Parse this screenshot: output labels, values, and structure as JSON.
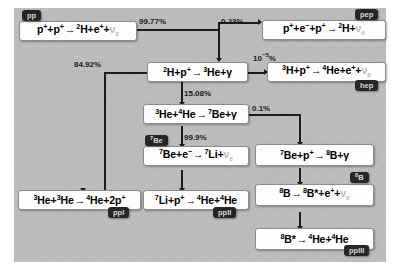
{
  "diagram": {
    "colors": {
      "plate": "#bdbdbd",
      "box": "#fdfdfd",
      "tag": "#262626",
      "tag_text": "#d8d8d8",
      "line": "#1c1c1c",
      "neutrino": "#b9b9b9"
    }
  },
  "reactions": {
    "pp": {
      "tag": "pp",
      "parts": [
        {
          "t": "p",
          "sup": "+"
        },
        {
          "t": "+"
        },
        {
          "t": "p",
          "sup": "+"
        },
        {
          "t": "→",
          "cls": "arr"
        },
        {
          "pre": "2",
          "t": "H"
        },
        {
          "t": "+"
        },
        {
          "t": "e",
          "sup": "+"
        },
        {
          "t": "+"
        },
        {
          "t": "ν",
          "sub": "e",
          "cls": "nu"
        }
      ],
      "plain": "p+ + p+ → 2H + e+ + νe"
    },
    "pep": {
      "tag": "pep",
      "parts": [
        {
          "t": "p",
          "sup": "+"
        },
        {
          "t": "+"
        },
        {
          "t": "e",
          "sup": "−"
        },
        {
          "t": "+"
        },
        {
          "t": "p",
          "sup": "+"
        },
        {
          "t": "→",
          "cls": "arr"
        },
        {
          "pre": "2",
          "t": "H"
        },
        {
          "t": "+"
        },
        {
          "t": "ν",
          "sub": "e",
          "cls": "nu"
        }
      ],
      "plain": "p+ + e− + p+ → 2H + νe"
    },
    "deuterium": {
      "tag": "",
      "parts": [
        {
          "pre": "2",
          "t": "H"
        },
        {
          "t": "+"
        },
        {
          "t": "p",
          "sup": "+"
        },
        {
          "t": "→",
          "cls": "arr"
        },
        {
          "pre": "3",
          "t": "He"
        },
        {
          "t": "+"
        },
        {
          "t": "γ",
          "cls": "gam"
        }
      ],
      "plain": "2H + p+ → 3He + γ"
    },
    "hep": {
      "tag": "hep",
      "parts": [
        {
          "pre": "3",
          "t": "H"
        },
        {
          "t": "+"
        },
        {
          "t": "p",
          "sup": "+"
        },
        {
          "t": "→",
          "cls": "arr"
        },
        {
          "pre": "4",
          "t": "He"
        },
        {
          "t": "+"
        },
        {
          "t": "e",
          "sup": "+"
        },
        {
          "t": "+"
        },
        {
          "t": "ν",
          "sub": "e",
          "cls": "nu"
        }
      ],
      "plain": "3H + p+ → 4He + e+ + νe"
    },
    "he3he4": {
      "tag": "",
      "parts": [
        {
          "pre": "3",
          "t": "He"
        },
        {
          "t": "+"
        },
        {
          "pre": "4",
          "t": "He"
        },
        {
          "t": "→",
          "cls": "arr"
        },
        {
          "pre": "7",
          "t": "Be"
        },
        {
          "t": "+"
        },
        {
          "t": "γ",
          "cls": "gam"
        }
      ],
      "plain": "3He + 4He → 7Be + γ"
    },
    "be7capture": {
      "tag_pre": "7",
      "tag": "Be",
      "parts": [
        {
          "pre": "7",
          "t": "Be"
        },
        {
          "t": "+"
        },
        {
          "t": "e",
          "sup": "−"
        },
        {
          "t": "→",
          "cls": "arr"
        },
        {
          "pre": "7",
          "t": "Li"
        },
        {
          "t": "+"
        },
        {
          "t": "ν",
          "sub": "e",
          "cls": "nu"
        }
      ],
      "plain": "7Be + e− → 7Li + νe"
    },
    "ppI": {
      "tag": "ppI",
      "parts": [
        {
          "pre": "3",
          "t": "He"
        },
        {
          "t": "+"
        },
        {
          "pre": "3",
          "t": "He"
        },
        {
          "t": "→",
          "cls": "arr"
        },
        {
          "pre": "4",
          "t": "He"
        },
        {
          "t": "+2"
        },
        {
          "t": "p",
          "sup": "+"
        }
      ],
      "plain": "3He + 3He → 4He + 2p+"
    },
    "ppII": {
      "tag": "ppII",
      "parts": [
        {
          "pre": "7",
          "t": "Li"
        },
        {
          "t": "+"
        },
        {
          "t": "p",
          "sup": "+"
        },
        {
          "t": "→",
          "cls": "arr"
        },
        {
          "pre": "4",
          "t": "He"
        },
        {
          "t": "+"
        },
        {
          "pre": "4",
          "t": "He"
        }
      ],
      "plain": "7Li + p+ → 4He + 4He"
    },
    "b8form": {
      "tag": "",
      "parts": [
        {
          "pre": "7",
          "t": "Be"
        },
        {
          "t": "+"
        },
        {
          "t": "p",
          "sup": "+"
        },
        {
          "t": "→",
          "cls": "arr"
        },
        {
          "pre": "8",
          "t": "B"
        },
        {
          "t": "+"
        },
        {
          "t": "γ",
          "cls": "gam"
        }
      ],
      "plain": "7Be + p+ → 8B + γ"
    },
    "b8decay": {
      "tag_pre": "8",
      "tag": "B",
      "parts": [
        {
          "pre": "8",
          "t": "B"
        },
        {
          "t": "→",
          "cls": "arr"
        },
        {
          "pre": "8",
          "t": "B*"
        },
        {
          "t": "+"
        },
        {
          "t": "e",
          "sup": "+"
        },
        {
          "t": "+"
        },
        {
          "t": "ν",
          "sub": "e",
          "cls": "nu"
        }
      ],
      "plain": "8B → 8B* + e+ + νe"
    },
    "ppIII": {
      "tag": "ppIII",
      "parts": [
        {
          "pre": "8",
          "t": "B*"
        },
        {
          "t": "→",
          "cls": "arr"
        },
        {
          "pre": "4",
          "t": "He"
        },
        {
          "t": "+"
        },
        {
          "pre": "4",
          "t": "He"
        }
      ],
      "plain": "8B* → 4He + 4He"
    }
  },
  "branches": {
    "pp_to_deuterium": "99.77%",
    "pep_branch": "0.23%",
    "to_ppI": "84.92%",
    "to_be7": "15.08%",
    "hep_branch_base": "10",
    "hep_branch_exp": "−5",
    "hep_branch_unit": "%",
    "be7_capture": "99.9%",
    "b8_branch": "0.1%"
  }
}
